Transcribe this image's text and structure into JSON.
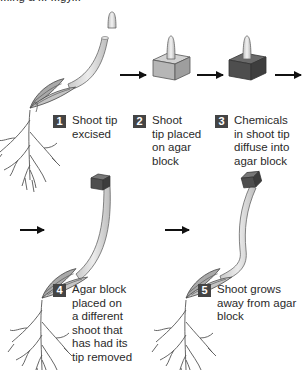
{
  "title_cut": "...ing a ... ...gy...",
  "steps": [
    {
      "number": "1",
      "lines": [
        "Shoot tip",
        "excised"
      ]
    },
    {
      "number": "2",
      "lines": [
        "Shoot",
        "tip placed",
        "on agar",
        "block"
      ]
    },
    {
      "number": "3",
      "lines": [
        "Chemicals",
        "in shoot tip",
        "diffuse into",
        "agar block"
      ]
    },
    {
      "number": "4",
      "lines": [
        "Agar block",
        "placed on",
        "a different",
        "shoot that",
        "has had its",
        "tip removed"
      ]
    },
    {
      "number": "5",
      "lines": [
        "Shoot grows",
        "away from agar",
        "block"
      ]
    }
  ],
  "colors": {
    "badge": "#444444",
    "agar_light": "#b8b8b8",
    "agar_dark": "#5a5a5a",
    "stem": "#d4d4d4",
    "arrow": "#111111"
  }
}
